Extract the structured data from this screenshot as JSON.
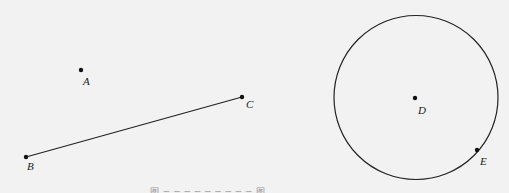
{
  "figure": {
    "background": "#f2f2f2",
    "stroke_color": "#222222",
    "points": [
      {
        "name": "A",
        "x": 81,
        "y": 70,
        "label_x": 83,
        "label_y": 76
      },
      {
        "name": "B",
        "x": 26,
        "y": 157,
        "label_x": 27,
        "label_y": 161
      },
      {
        "name": "C",
        "x": 242,
        "y": 97,
        "label_x": 246,
        "label_y": 99
      },
      {
        "name": "D",
        "x": 415,
        "y": 98,
        "label_x": 418,
        "label_y": 105
      },
      {
        "name": "E",
        "x": 477,
        "y": 150,
        "label_x": 480,
        "label_y": 156
      }
    ],
    "segment": {
      "from": "B",
      "to": "C"
    },
    "circle": {
      "center": "D",
      "cx": 416,
      "cy": 97.5,
      "r": 82,
      "through": "E"
    },
    "labels": {
      "A": "A",
      "B": "B",
      "C": "C",
      "D": "D",
      "E": "E"
    },
    "caption": "图 ─ ─ ─ ─ ─ ─ ─ ─ ─ 图"
  }
}
